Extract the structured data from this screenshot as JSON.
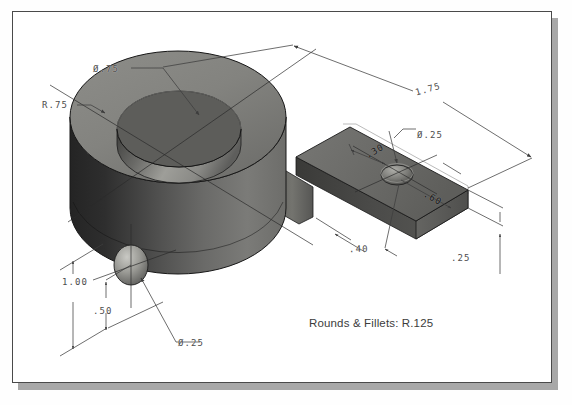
{
  "document": {
    "type": "isometric-technical-drawing",
    "background_color": "#ffffff",
    "sheet_border_color": "#4a4a4a",
    "shadow_color": "#a8a8a8"
  },
  "note": {
    "text": "Rounds & Fillets: R.125"
  },
  "dimensions": [
    {
      "id": "dia-75",
      "label": "Ø.75",
      "target": "top-through-hole-diameter"
    },
    {
      "id": "r-75",
      "label": "R.75",
      "target": "cylinder-boss-radius"
    },
    {
      "id": "len-175",
      "label": "1.75",
      "target": "overall-length"
    },
    {
      "id": "dia-25-tab",
      "label": "Ø.25",
      "target": "tab-hole-diameter"
    },
    {
      "id": "w-30",
      "label": ".30",
      "target": "tab-hole-edge-offset"
    },
    {
      "id": "w-60",
      "label": ".60",
      "target": "tab-width"
    },
    {
      "id": "w-40",
      "label": ".40",
      "target": "tab-hole-center-offset"
    },
    {
      "id": "t-25",
      "label": ".25",
      "target": "tab-thickness"
    },
    {
      "id": "h-100",
      "label": "1.00",
      "target": "cylinder-height"
    },
    {
      "id": "h-50",
      "label": ".50",
      "target": "side-hole-center-height"
    },
    {
      "id": "dia-25-side",
      "label": "Ø.25",
      "target": "side-hole-diameter"
    }
  ],
  "shading": {
    "top_face": "#82827f",
    "top_face_dark": "#6f6f6c",
    "cylinder_dark": "#2b2b2b",
    "cylinder_mid": "#5c5c5c",
    "cylinder_light": "#7c7c79",
    "bore_dark": "#4a4a48",
    "bore_light": "#a3a39f",
    "tab_top": "#6a6a68",
    "tab_front": "#4e4e4c",
    "tab_end": "#606060",
    "edge_line": "#1c1c1c"
  }
}
